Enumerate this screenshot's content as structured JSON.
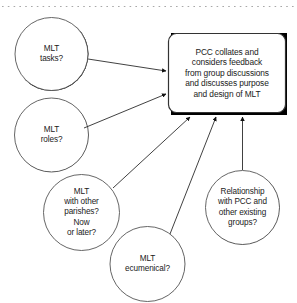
{
  "diagram": {
    "background_color": "#ffffff",
    "text_color": "#1a1a1a",
    "shadow_color": "#000000",
    "outline_color": "#4d4d4d",
    "divider": {
      "style": "dotted",
      "color": "#aaaaaa"
    },
    "nodes": [
      {
        "id": "mlt-tasks",
        "shape": "circle",
        "label": "MLT\ntasks?",
        "cx": 51.5,
        "cy": 54,
        "r": 36.5
      },
      {
        "id": "mlt-roles",
        "shape": "circle",
        "label": "MLT\nroles?",
        "cx": 51.5,
        "cy": 135,
        "r": 37
      },
      {
        "id": "mlt-other-parishes",
        "shape": "circle",
        "label": "MLT\nwith other\nparishes?\nNow\nor later?",
        "cx": 81.5,
        "cy": 212.5,
        "r": 38.5
      },
      {
        "id": "mlt-ecumenical",
        "shape": "circle",
        "label": "MLT\necumenical?",
        "cx": 147.5,
        "cy": 264,
        "r": 37.5
      },
      {
        "id": "relationship-pcc",
        "shape": "circle",
        "label": "Relationship\nwith PCC and\nother existing\ngroups?",
        "cx": 242.5,
        "cy": 207.5,
        "r": 37.5
      },
      {
        "id": "pcc-collates",
        "shape": "rounded-rectangle",
        "label": "PCC collates and\nconsiders feedback\nfrom group discussions\nand discusses purpose\nand design of MLT",
        "x": 168,
        "y": 33,
        "width": 119,
        "height": 80
      }
    ],
    "edges": [
      {
        "id": "edge-tasks-to-pcc",
        "from": "mlt-tasks",
        "to": "pcc-collates",
        "arrowhead": "filled-triangle"
      },
      {
        "id": "edge-roles-to-pcc",
        "from": "mlt-roles",
        "to": "pcc-collates",
        "arrowhead": "filled-triangle"
      },
      {
        "id": "edge-parishes-to-pcc",
        "from": "mlt-other-parishes",
        "to": "pcc-collates",
        "arrowhead": "filled-triangle"
      },
      {
        "id": "edge-ecumenical-to-pcc",
        "from": "mlt-ecumenical",
        "to": "pcc-collates",
        "arrowhead": "filled-triangle"
      },
      {
        "id": "edge-relationship-to-pcc",
        "from": "relationship-pcc",
        "to": "pcc-collates",
        "arrowhead": "filled-triangle"
      }
    ]
  }
}
